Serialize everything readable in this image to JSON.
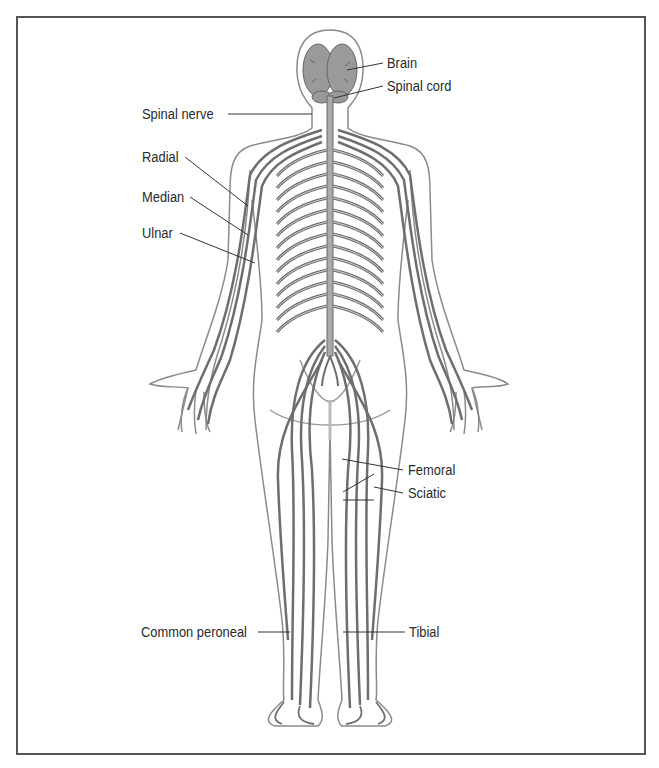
{
  "figure": {
    "labels": {
      "brain": "Brain",
      "spinal_cord": "Spinal cord",
      "spinal_nerve": "Spinal nerve",
      "radial": "Radial",
      "median": "Median",
      "ulnar": "Ulnar",
      "femoral": "Femoral",
      "sciatic": "Sciatic",
      "common_peroneal": "Common peroneal",
      "tibial": "Tibial"
    },
    "colors": {
      "border": "#555555",
      "outline": "#888888",
      "nerve": "#7a7a7a",
      "brain_fill": "#9a9a9a",
      "text": "#2a2a2a"
    }
  }
}
